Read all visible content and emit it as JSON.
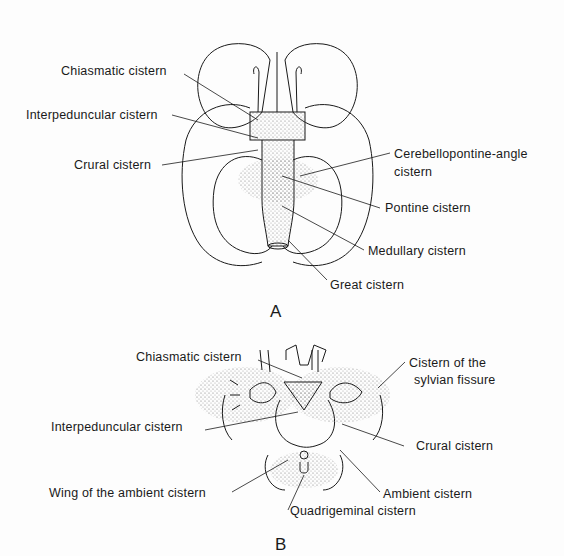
{
  "figure": {
    "panels": [
      {
        "id": "A",
        "letter": "A",
        "view": "inferior view of brain",
        "labels": [
          {
            "text": "Chiasmatic cistern"
          },
          {
            "text": "Interpeduncular cistern"
          },
          {
            "text": "Crural cistern"
          },
          {
            "text": "Cerebellopontine-angle"
          },
          {
            "text": "cistern"
          },
          {
            "text": "Pontine cistern"
          },
          {
            "text": "Medullary  cistern"
          },
          {
            "text": "Great cistern"
          }
        ]
      },
      {
        "id": "B",
        "letter": "B",
        "view": "axial section through midbrain",
        "labels": [
          {
            "text": "Chiasmatic cistern"
          },
          {
            "text": "Cistern of the"
          },
          {
            "text": "sylvian fissure"
          },
          {
            "text": "Interpeduncular cistern"
          },
          {
            "text": "Crural cistern"
          },
          {
            "text": "Wing of the ambient cistern"
          },
          {
            "text": "Ambient cistern"
          },
          {
            "text": "Quadrigeminal cistern"
          }
        ]
      }
    ],
    "colors": {
      "ink": "#1a1a1a",
      "stipple": "#9a9a9a",
      "background": "#fdfdfd"
    }
  }
}
